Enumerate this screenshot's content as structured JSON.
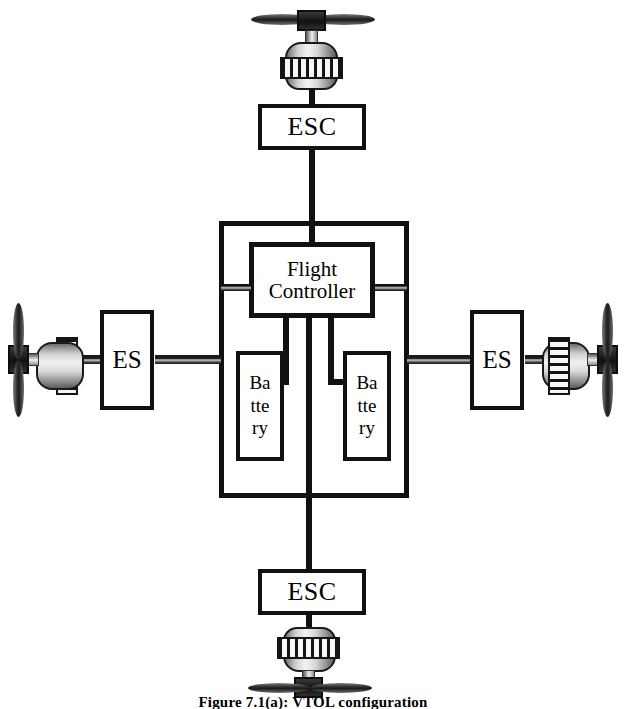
{
  "figure": {
    "caption_label": "Figure 7.1(a):",
    "caption_text": "VTOL configuration"
  },
  "components": {
    "esc_top": {
      "label": "ESC",
      "name": "Electronic Speed Controller"
    },
    "esc_bottom": {
      "label": "ESC",
      "name": "Electronic Speed Controller"
    },
    "esc_left": {
      "label": "ES",
      "name": "Electronic Speed Controller"
    },
    "esc_right": {
      "label": "ES",
      "name": "Electronic Speed Controller"
    },
    "flight_controller": {
      "label": "Flight\nController"
    },
    "battery_left": {
      "label": "Ba\ntte\nry"
    },
    "battery_right": {
      "label": "Ba\ntte\nry"
    }
  },
  "motors": {
    "top": {
      "label": "motor-propeller-top"
    },
    "bottom": {
      "label": "motor-propeller-bottom"
    },
    "left": {
      "label": "motor-propeller-left"
    },
    "right": {
      "label": "motor-propeller-right"
    }
  },
  "colors": {
    "line": "#111111",
    "background": "#ffffff",
    "metal_light": "#f2f2f2",
    "metal_dark": "#5c5c5c"
  }
}
